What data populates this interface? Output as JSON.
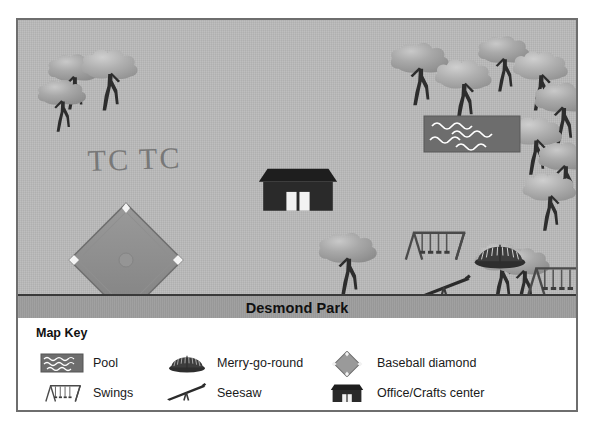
{
  "figure": {
    "kind": "park-map-with-legend"
  },
  "map": {
    "title": "Desmond Park",
    "annotation": "TC TC",
    "background_color": "#b9b9b9",
    "border_color": "#6e6e6e",
    "title_bar_color": "#9d9d9d",
    "features": [
      {
        "name": "pool",
        "label": "Pool"
      },
      {
        "name": "office-crafts-center",
        "label": "Office/Crafts center"
      },
      {
        "name": "baseball-diamond",
        "label": "Baseball diamond"
      },
      {
        "name": "swings-north",
        "label": "Swings"
      },
      {
        "name": "swings-east",
        "label": "Swings"
      },
      {
        "name": "merry-go-round",
        "label": "Merry-go-round"
      },
      {
        "name": "seesaw",
        "label": "Seesaw"
      }
    ]
  },
  "legend": {
    "title": "Map Key",
    "columns": [
      {
        "items": [
          {
            "icon": "pool-icon",
            "label": "Pool"
          },
          {
            "icon": "swings-icon",
            "label": "Swings"
          }
        ]
      },
      {
        "items": [
          {
            "icon": "merry-go-round-icon",
            "label": "Merry-go-round"
          },
          {
            "icon": "seesaw-icon",
            "label": "Seesaw"
          }
        ]
      },
      {
        "items": [
          {
            "icon": "baseball-diamond-icon",
            "label": "Baseball diamond"
          },
          {
            "icon": "office-crafts-center-icon",
            "label": "Office/Crafts center"
          }
        ]
      }
    ]
  },
  "compass": {
    "north": "N",
    "south": "S",
    "east": "E",
    "west": "W",
    "northwest": "NW",
    "northeast": "NE",
    "southwest": "SW",
    "southeast": "SE"
  }
}
